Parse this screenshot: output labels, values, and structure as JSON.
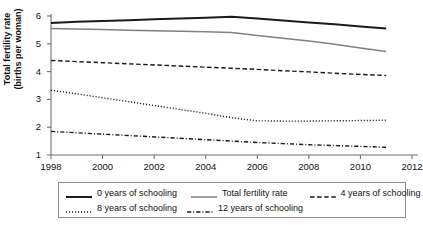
{
  "figure": {
    "clipped_title_fragment": "",
    "background_color": "#ffffff"
  },
  "axes": {
    "ylabel_line1": "Total fertility rate",
    "ylabel_line2": "(births per woman)",
    "xlabel": "",
    "yticks": [
      "1",
      "2",
      "3",
      "4",
      "5",
      "6"
    ],
    "xticks": [
      "1998",
      "2000",
      "2002",
      "2004",
      "2006",
      "2008",
      "2010",
      "2012"
    ]
  },
  "legend": {
    "entries": [
      {
        "label": "0 years of schooling",
        "style": "solid",
        "color": "#1a1a1a",
        "width": 2.0
      },
      {
        "label": "Total fertility rate",
        "style": "solid",
        "color": "#808080",
        "width": 1.5
      },
      {
        "label": "4 years of schooling",
        "style": "dashed",
        "color": "#1a1a1a",
        "width": 1.4
      },
      {
        "label": "8 years of schooling",
        "style": "dotted",
        "color": "#1a1a1a",
        "width": 1.3
      },
      {
        "label": "12 years of schooling",
        "style": "dashdot",
        "color": "#1a1a1a",
        "width": 1.3
      }
    ]
  },
  "chart_data": {
    "type": "line",
    "title": "",
    "xlabel": "",
    "ylabel": "Total fertility rate (births per woman)",
    "xlim": [
      1998,
      2012
    ],
    "ylim": [
      1,
      6
    ],
    "grid": false,
    "legend_position": "below-axes",
    "x": [
      1998,
      1999,
      2000,
      2001,
      2002,
      2003,
      2004,
      2005,
      2006,
      2007,
      2008,
      2009,
      2010,
      2011
    ],
    "series": [
      {
        "name": "0 years of schooling",
        "style": "solid",
        "color": "#1a1a1a",
        "values": [
          5.75,
          5.79,
          5.82,
          5.85,
          5.88,
          5.91,
          5.94,
          5.97,
          5.91,
          5.84,
          5.77,
          5.7,
          5.62,
          5.55
        ]
      },
      {
        "name": "Total fertility rate",
        "style": "solid",
        "color": "#808080",
        "values": [
          5.55,
          5.53,
          5.51,
          5.49,
          5.47,
          5.45,
          5.43,
          5.41,
          5.3,
          5.2,
          5.1,
          4.98,
          4.85,
          4.72
        ]
      },
      {
        "name": "4 years of schooling",
        "style": "dashed",
        "color": "#1a1a1a",
        "values": [
          4.4,
          4.36,
          4.32,
          4.28,
          4.24,
          4.2,
          4.16,
          4.12,
          4.08,
          4.03,
          3.99,
          3.94,
          3.9,
          3.86
        ]
      },
      {
        "name": "8 years of schooling",
        "style": "dotted",
        "color": "#1a1a1a",
        "values": [
          3.33,
          3.2,
          3.06,
          2.92,
          2.78,
          2.64,
          2.5,
          2.34,
          2.23,
          2.22,
          2.22,
          2.23,
          2.24,
          2.25
        ]
      },
      {
        "name": "12 years of schooling",
        "style": "dashdot",
        "color": "#1a1a1a",
        "values": [
          1.85,
          1.8,
          1.75,
          1.7,
          1.65,
          1.6,
          1.55,
          1.5,
          1.45,
          1.41,
          1.37,
          1.34,
          1.31,
          1.28
        ]
      }
    ]
  }
}
